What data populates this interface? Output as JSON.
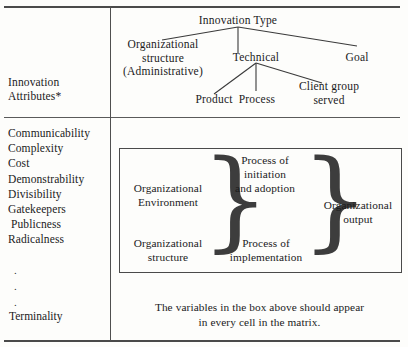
{
  "figure": {
    "left_column": {
      "header_line1": "Innovation",
      "header_line2": "Attributes*",
      "attributes": [
        "Communicability",
        "Complexity",
        "Cost",
        "Demonstrability",
        "Divisibility",
        "Gatekeepers",
        "Publicness",
        "Radicalness"
      ],
      "ellipsis_dots": ".\n.\n.",
      "last_attribute": "Terminality"
    },
    "tree": {
      "root": "Innovation Type",
      "branch_left_line1": "Organizational",
      "branch_left_line2": "structure",
      "branch_left_line3": "(Administrative)",
      "branch_middle": "Technical",
      "branch_right": "Goal",
      "leaf_1": "Product",
      "leaf_2": "Process",
      "leaf_3_line1": "Client group",
      "leaf_3_line2": "served"
    },
    "process_box": {
      "row1_col1_line1": "Organizational",
      "row1_col1_line2": "Environment",
      "row1_col2_line1": "Process of",
      "row1_col2_line2": "initiation",
      "row1_col2_line3": "and adoption",
      "row2_col1_line1": "Organizational",
      "row2_col1_line2": "structure",
      "row2_col2_line1": "Process of",
      "row2_col2_line2": "implementation",
      "output_line1": "Organizational",
      "output_line2": "output",
      "brace_glyph": "}"
    },
    "note": {
      "line1": "The variables in the box above should appear",
      "line2": "in every cell in the matrix."
    }
  }
}
